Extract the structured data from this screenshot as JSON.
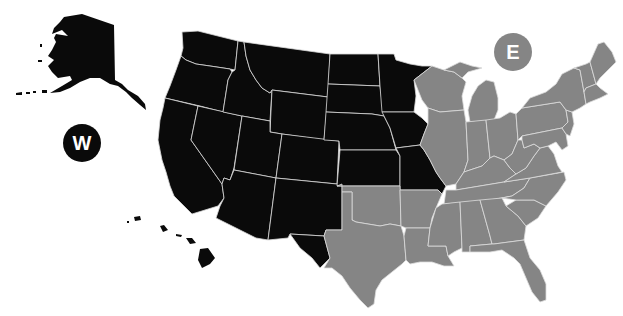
{
  "map": {
    "title": "United States West / East regions",
    "regions": [
      {
        "id": "west",
        "label": "W",
        "color": "#0a0a0a",
        "states": [
          "WA",
          "OR",
          "CA",
          "NV",
          "ID",
          "MT",
          "WY",
          "UT",
          "AZ",
          "CO",
          "NM",
          "ND",
          "SD",
          "NE",
          "KS",
          "MN",
          "IA",
          "MO",
          "AK",
          "HI",
          "TX-west (El Paso)",
          "OK-panhandle-west"
        ]
      },
      {
        "id": "east",
        "label": "E",
        "color": "#858585",
        "states": [
          "TX",
          "OK",
          "AR",
          "LA",
          "WI",
          "IL",
          "MI",
          "IN",
          "OH",
          "KY",
          "TN",
          "MS",
          "AL",
          "GA",
          "FL",
          "SC",
          "NC",
          "VA",
          "WV",
          "PA",
          "NY",
          "NJ",
          "DE",
          "MD",
          "CT",
          "RI",
          "MA",
          "VT",
          "NH",
          "ME"
        ]
      }
    ],
    "background": "#ffffff",
    "border_color": "#d8d8d8"
  }
}
